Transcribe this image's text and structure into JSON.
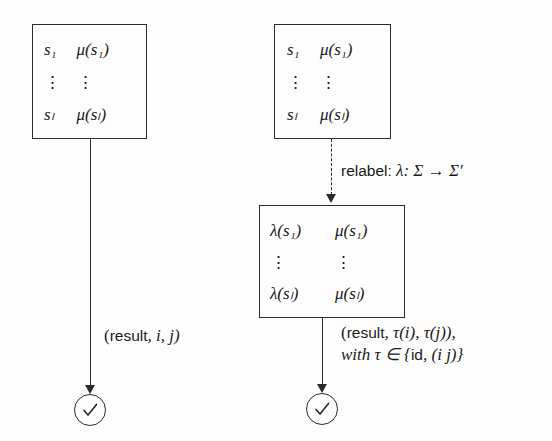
{
  "diagram": {
    "colors": {
      "ink": "#2b2b2b",
      "background": "#fdfdfd"
    }
  },
  "boxes": {
    "left": {
      "name": "original-table-left",
      "rows": [
        {
          "c1": "s₁",
          "c2": "μ(s₁)"
        },
        {
          "c1": "⋮",
          "c2": "⋮"
        },
        {
          "c1": "sₗ",
          "c2": "μ(sₗ)"
        }
      ]
    },
    "right_top": {
      "name": "original-table-right",
      "rows": [
        {
          "c1": "s₁",
          "c2": "μ(s₁)"
        },
        {
          "c1": "⋮",
          "c2": "⋮"
        },
        {
          "c1": "sₗ",
          "c2": "μ(sₗ)"
        }
      ]
    },
    "right_bottom": {
      "name": "relabeled-table",
      "rows": [
        {
          "c1": "λ(s₁)",
          "c2": "μ(s₁)"
        },
        {
          "c1": "⋮",
          "c2": "⋮"
        },
        {
          "c1": "λ(sₗ)",
          "c2": "μ(sₗ)"
        }
      ]
    }
  },
  "labels": {
    "relabel": {
      "prefix": "relabel:",
      "math": "λ: Σ → Σ′"
    },
    "left_result": {
      "open": "(",
      "word": "result",
      "rest": ", i, j)"
    },
    "right_result": {
      "line1_open": "(",
      "line1_word": "result",
      "line1_rest": ", τ(i), τ(j)),",
      "line2_with": "with τ ∈ {",
      "line2_id": "id",
      "line2_rest": ", (i j)}"
    }
  },
  "nodes": {
    "left_check": {
      "name": "accept-check-left",
      "glyph": "✓"
    },
    "right_check": {
      "name": "accept-check-right",
      "glyph": "✓"
    }
  }
}
